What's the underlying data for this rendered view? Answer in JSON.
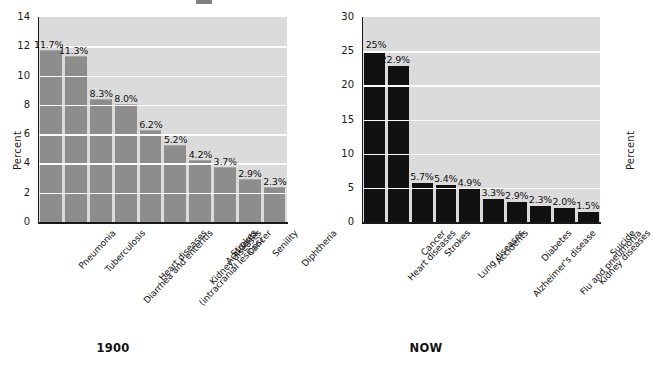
{
  "chart_data": [
    {
      "type": "bar",
      "id": "1900",
      "title": "1900",
      "caption": "1900",
      "ylabel": "Percent",
      "xlabel": "",
      "ylim": [
        0,
        14
      ],
      "yticks": [
        0,
        2,
        4,
        6,
        8,
        10,
        12,
        14
      ],
      "ytick_labels": [
        "0",
        "2",
        "4",
        "6",
        "8",
        "10",
        "12",
        "14"
      ],
      "grid": true,
      "legend": "none",
      "bar_color": "#8d8d8d",
      "plot_background": "#dbdbdb",
      "gridline_color": "#fbfbfb",
      "categories": [
        "Pneumonia",
        "Tuberculosis",
        "Diarrhea and enteritis",
        "Heart diseases",
        "Strokes (intracranial lesions)",
        "Kidney diseases",
        "Accidents",
        "Cancer",
        "Senility",
        "Diphtheria"
      ],
      "category_lines": [
        [
          "Pneumonia"
        ],
        [
          "Tuberculosis"
        ],
        [
          "Diarrhea and enteritis"
        ],
        [
          "Heart diseases"
        ],
        [
          "Strokes",
          "(intracranial lesions)"
        ],
        [
          "Kidney diseases"
        ],
        [
          "Accidents"
        ],
        [
          "Cancer"
        ],
        [
          "Senility"
        ],
        [
          "Diphtheria"
        ]
      ],
      "values": [
        11.7,
        11.3,
        8.3,
        8.0,
        6.2,
        5.2,
        4.2,
        3.7,
        2.9,
        2.3
      ],
      "data_labels": [
        "11.7%",
        "11.3%",
        "8.3%",
        "8.0%",
        "6.2%",
        "5.2%",
        "4.2%",
        "3.7%",
        "2.9%",
        "2.3%"
      ]
    },
    {
      "type": "bar",
      "id": "now",
      "title": "NOW",
      "caption": "NOW",
      "ylabel": "Percent",
      "xlabel": "",
      "ylim": [
        0,
        30
      ],
      "yticks": [
        0,
        5,
        10,
        15,
        20,
        25,
        30
      ],
      "ytick_labels": [
        "0",
        "5",
        "10",
        "15",
        "20",
        "25",
        "30"
      ],
      "grid": true,
      "legend": "none",
      "bar_color": "#111111",
      "plot_background": "#dbdbdb",
      "gridline_color": "#fbfbfb",
      "categories": [
        "Heart diseases",
        "Cancer",
        "Strokes",
        "Lung diseases",
        "Accidents",
        "Alzheimer's disease",
        "Diabetes",
        "Flu and pneumonia",
        "Kidney diseases",
        "Suicide"
      ],
      "category_lines": [
        [
          "Heart diseases"
        ],
        [
          "Cancer"
        ],
        [
          "Strokes"
        ],
        [
          "Lung diseases"
        ],
        [
          "Accidents"
        ],
        [
          "Alzheimer's disease"
        ],
        [
          "Diabetes"
        ],
        [
          "Flu and pneumonia"
        ],
        [
          "Kidney diseases"
        ],
        [
          "Suicide"
        ]
      ],
      "values": [
        25.0,
        22.9,
        5.7,
        5.4,
        4.9,
        3.3,
        2.9,
        2.3,
        2.0,
        1.5
      ],
      "data_labels": [
        "25%",
        "22.9%",
        "5.7%",
        "5.4%",
        "4.9%",
        "3.3%",
        "2.9%",
        "2.3%",
        "2.0%",
        "1.5%"
      ]
    }
  ]
}
